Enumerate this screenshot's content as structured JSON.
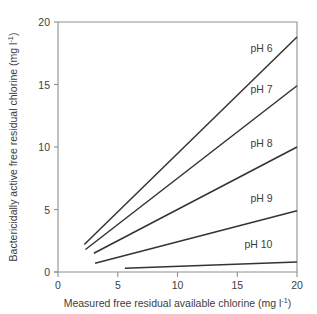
{
  "chart_data": {
    "type": "line",
    "title": "",
    "xlabel": "Measured free residual available chlorine (mg l-1)",
    "xlabel_main": "Measured free residual available chlorine (mg l",
    "xlabel_sup": "-1",
    "xlabel_tail": ")",
    "ylabel": "Bactericidally active free residual chlorine (mg l-1)",
    "ylabel_main": "Bactericidally active free residual chlorine (mg l",
    "ylabel_sup": "-1",
    "ylabel_tail": ")",
    "xlim": [
      0,
      20
    ],
    "ylim": [
      0,
      20
    ],
    "xticks": [
      "0",
      "5",
      "10",
      "15",
      "20"
    ],
    "xtick_values": [
      0,
      5,
      10,
      15,
      20
    ],
    "yticks": [
      "0",
      "5",
      "10",
      "15",
      "20"
    ],
    "ytick_values": [
      0,
      5,
      10,
      15,
      20
    ],
    "grid": false,
    "legend_position": "inline-end-of-line",
    "line_color": "#333333",
    "frame_color": "#8f8f8f",
    "series": [
      {
        "name": "pH 6",
        "label": "pH 6",
        "x": [
          2.2,
          20
        ],
        "y": [
          2.2,
          18.8
        ],
        "label_x": 16.1,
        "label_y": 17.6
      },
      {
        "name": "pH 7",
        "label": "pH 7",
        "x": [
          2.3,
          20
        ],
        "y": [
          1.8,
          14.9
        ],
        "label_x": 16.1,
        "label_y": 14.3
      },
      {
        "name": "pH 8",
        "label": "pH 8",
        "x": [
          3.0,
          20
        ],
        "y": [
          1.5,
          10.0
        ],
        "label_x": 16.1,
        "label_y": 10.0
      },
      {
        "name": "pH 9",
        "label": "pH 9",
        "x": [
          3.1,
          20
        ],
        "y": [
          0.7,
          4.9
        ],
        "label_x": 16.1,
        "label_y": 5.6
      },
      {
        "name": "pH 10",
        "label": "pH 10",
        "x": [
          5.6,
          20
        ],
        "y": [
          0.3,
          0.8
        ],
        "label_x": 15.6,
        "label_y": 1.9
      }
    ]
  }
}
